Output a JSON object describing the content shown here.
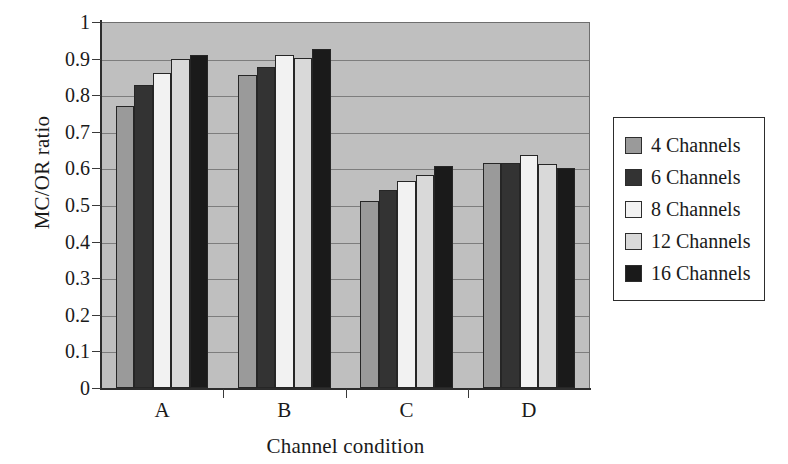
{
  "chart_data": {
    "type": "bar",
    "title": "",
    "xlabel": "Channel condition",
    "ylabel": "MC/OR ratio",
    "categories": [
      "A",
      "B",
      "C",
      "D"
    ],
    "ylim": [
      0,
      1
    ],
    "yticks": [
      "0",
      "0.1",
      "0.2",
      "0.3",
      "0.4",
      "0.5",
      "0.6",
      "0.7",
      "0.8",
      "0.9",
      "1"
    ],
    "ytick_values": [
      0,
      0.1,
      0.2,
      0.3,
      0.4,
      0.5,
      0.6,
      0.7,
      0.8,
      0.9,
      1
    ],
    "grid": true,
    "legend_position": "right",
    "series": [
      {
        "name": "4 Channels",
        "color": "#9a9a9a",
        "values": [
          0.77,
          0.855,
          0.51,
          0.615
        ]
      },
      {
        "name": "6 Channels",
        "color": "#333333",
        "values": [
          0.828,
          0.877,
          0.54,
          0.615
        ]
      },
      {
        "name": "8 Channels",
        "color": "#f2f2f2",
        "values": [
          0.862,
          0.91,
          0.566,
          0.638
        ]
      },
      {
        "name": "12 Channels",
        "color": "#d9d9d9",
        "values": [
          0.9,
          0.902,
          0.582,
          0.613
        ]
      },
      {
        "name": "16 Channels",
        "color": "#1a1a1a",
        "values": [
          0.91,
          0.925,
          0.607,
          0.6
        ]
      }
    ]
  },
  "axes": {
    "plot_background": "#bfbfbf",
    "gridline_color": "#7d7d7d",
    "axis_color": "#2d2d2d"
  },
  "legend": {
    "items": [
      {
        "label": "4 Channels",
        "color": "#9a9a9a"
      },
      {
        "label": "6 Channels",
        "color": "#333333"
      },
      {
        "label": "8 Channels",
        "color": "#f2f2f2"
      },
      {
        "label": "12 Channels",
        "color": "#d9d9d9"
      },
      {
        "label": "16 Channels",
        "color": "#1a1a1a"
      }
    ]
  }
}
